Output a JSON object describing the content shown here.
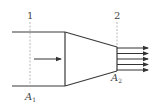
{
  "diagram": {
    "type": "nozzle-flow",
    "colors": {
      "line": "#3a3a3a",
      "dashed": "#9a9a9a",
      "arrow": "#333333",
      "text": "#444444"
    },
    "sections": [
      {
        "id": "section-1",
        "number_label": "1",
        "area_label": "A",
        "area_subscript": "1"
      },
      {
        "id": "section-2",
        "number_label": "2",
        "area_label": "A",
        "area_subscript": "2"
      }
    ],
    "inlet_arrow": {
      "direction": "right"
    },
    "outlet_arrows": {
      "count": 5,
      "direction": "right"
    }
  }
}
